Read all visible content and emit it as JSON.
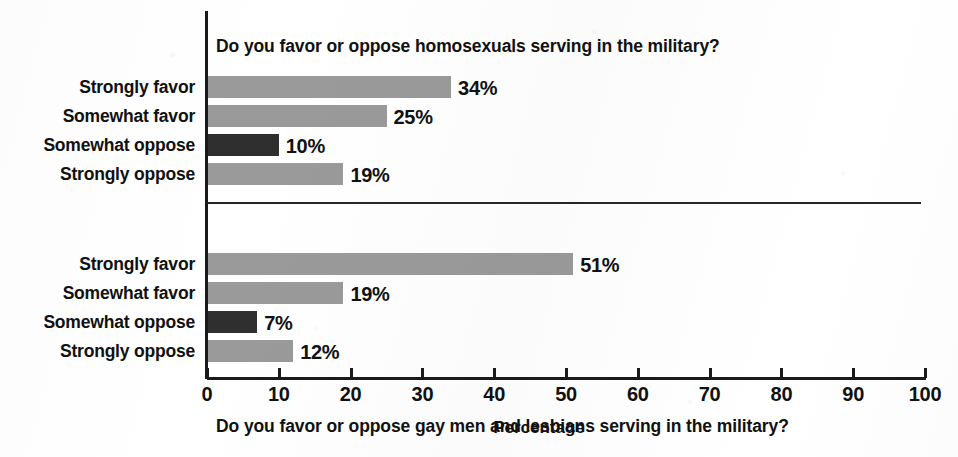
{
  "axis": {
    "xlabel": "Percentage",
    "xticks": [
      "0",
      "10",
      "20",
      "30",
      "40",
      "50",
      "60",
      "70",
      "80",
      "90",
      "100"
    ]
  },
  "colors": {
    "bar_light": "#9a9a9a",
    "bar_dark": "#2f2f2f",
    "axis": "#1a1a1a",
    "text": "#111111",
    "background": "#ffffff"
  },
  "panels": [
    {
      "title_prefix": "Do you favor or oppose ",
      "title_emphasis": "homosexuals",
      "title_suffix": " serving in the military?",
      "title_full": "Do you favor or oppose homosexuals serving in the military?",
      "categories": [
        "Strongly favor",
        "Somewhat favor",
        "Somewhat oppose",
        "Strongly oppose"
      ],
      "values": [
        34,
        25,
        10,
        19
      ],
      "value_labels": [
        "34%",
        "25%",
        "10%",
        "19%"
      ]
    },
    {
      "title_prefix": "Do you favor or oppose ",
      "title_emphasis": "gay men and lesbians",
      "title_suffix": " serving in the military?",
      "title_full": "Do you favor or oppose gay men and lesbians serving in the military?",
      "categories": [
        "Strongly favor",
        "Somewhat favor",
        "Somewhat oppose",
        "Strongly oppose"
      ],
      "values": [
        51,
        19,
        7,
        12
      ],
      "value_labels": [
        "51%",
        "19%",
        "7%",
        "12%"
      ]
    }
  ],
  "chart_data": {
    "type": "bar",
    "orientation": "horizontal",
    "title": "",
    "xlabel": "Percentage",
    "ylabel": "",
    "xlim": [
      0,
      100
    ],
    "xticks": [
      0,
      10,
      20,
      30,
      40,
      50,
      60,
      70,
      80,
      90,
      100
    ],
    "grid": false,
    "legend": false,
    "panels": [
      {
        "title": "Do you favor or oppose homosexuals serving in the military?",
        "categories": [
          "Strongly favor",
          "Somewhat favor",
          "Somewhat oppose",
          "Strongly oppose"
        ],
        "values": [
          34,
          25,
          10,
          19
        ],
        "bar_colors": [
          "#9a9a9a",
          "#9a9a9a",
          "#2f2f2f",
          "#9a9a9a"
        ],
        "data_labels": [
          "34%",
          "25%",
          "10%",
          "19%"
        ]
      },
      {
        "title": "Do you favor or oppose gay men and lesbians serving in the military?",
        "categories": [
          "Strongly favor",
          "Somewhat favor",
          "Somewhat oppose",
          "Strongly oppose"
        ],
        "values": [
          51,
          19,
          7,
          12
        ],
        "bar_colors": [
          "#9a9a9a",
          "#9a9a9a",
          "#2f2f2f",
          "#9a9a9a"
        ],
        "data_labels": [
          "51%",
          "19%",
          "7%",
          "12%"
        ]
      }
    ]
  }
}
